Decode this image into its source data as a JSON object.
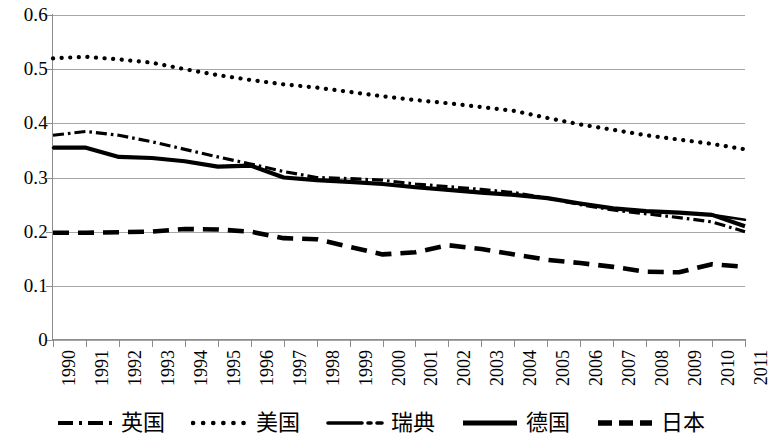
{
  "chart_data": {
    "type": "line",
    "title": "",
    "subtitle": "",
    "xlabel": "",
    "ylabel": "",
    "xlim": [
      1990,
      2011
    ],
    "ylim": [
      0,
      0.6
    ],
    "grid": true,
    "legend_position": "bottom",
    "y_ticks": [
      "0",
      "0.1",
      "0.2",
      "0.3",
      "0.4",
      "0.5",
      "0.6"
    ],
    "y_tick_values": [
      0,
      0.1,
      0.2,
      0.3,
      0.4,
      0.5,
      0.6
    ],
    "categories": [
      "1990",
      "1991",
      "1992",
      "1993",
      "1994",
      "1995",
      "1996",
      "1997",
      "1998",
      "1999",
      "2000",
      "2001",
      "2002",
      "2003",
      "2004",
      "2005",
      "2006",
      "2007",
      "2008",
      "2009",
      "2010",
      "2011"
    ],
    "x": [
      1990,
      1991,
      1992,
      1993,
      1994,
      1995,
      1996,
      1997,
      1998,
      1999,
      2000,
      2001,
      2002,
      2003,
      2004,
      2005,
      2006,
      2007,
      2008,
      2009,
      2010,
      2011
    ],
    "series": [
      {
        "name": "英国",
        "style": "dash-dot",
        "color": "#000000",
        "values": [
          0.378,
          0.385,
          0.378,
          0.366,
          0.352,
          0.338,
          0.325,
          0.311,
          0.3,
          0.298,
          0.295,
          0.288,
          0.283,
          0.278,
          0.272,
          0.262,
          0.25,
          0.24,
          0.233,
          0.226,
          0.218,
          0.2
        ]
      },
      {
        "name": "美国",
        "style": "dotted",
        "color": "#000000",
        "values": [
          0.52,
          0.523,
          0.518,
          0.512,
          0.5,
          0.489,
          0.48,
          0.472,
          0.466,
          0.458,
          0.45,
          0.443,
          0.437,
          0.43,
          0.423,
          0.41,
          0.398,
          0.388,
          0.378,
          0.37,
          0.362,
          0.352
        ]
      },
      {
        "name": "瑞典",
        "style": "solid-thin",
        "color": "#000000",
        "values": [
          0.355,
          0.355,
          0.338,
          0.336,
          0.33,
          0.32,
          0.322,
          0.3,
          0.295,
          0.292,
          0.288,
          0.282,
          0.277,
          0.272,
          0.268,
          0.262,
          0.252,
          0.243,
          0.238,
          0.235,
          0.231,
          0.222
        ]
      },
      {
        "name": "德国",
        "style": "solid-thick",
        "color": "#000000",
        "values": [
          0.355,
          0.355,
          0.338,
          0.336,
          0.33,
          0.32,
          0.322,
          0.3,
          0.295,
          0.292,
          0.288,
          0.282,
          0.277,
          0.272,
          0.268,
          0.262,
          0.252,
          0.243,
          0.238,
          0.235,
          0.231,
          0.21
        ]
      },
      {
        "name": "日本",
        "style": "long-dash",
        "color": "#000000",
        "values": [
          0.198,
          0.198,
          0.199,
          0.2,
          0.205,
          0.204,
          0.2,
          0.188,
          0.186,
          0.172,
          0.158,
          0.162,
          0.175,
          0.168,
          0.158,
          0.148,
          0.142,
          0.135,
          0.126,
          0.125,
          0.14,
          0.135
        ]
      }
    ]
  },
  "legend": {
    "items": [
      {
        "label": "英国",
        "swatch": "dash-dot-swatch"
      },
      {
        "label": "美国",
        "swatch": "dotted-swatch"
      },
      {
        "label": "瑞典",
        "swatch": "solid-thin-swatch"
      },
      {
        "label": "德国",
        "swatch": "solid-thick-swatch"
      },
      {
        "label": "日本",
        "swatch": "long-dash-swatch"
      }
    ]
  },
  "axes": {
    "y_labels": [
      "0.6",
      "0.5",
      "0.4",
      "0.3",
      "0.2",
      "0.1",
      "0"
    ],
    "x_labels": [
      "1990",
      "1991",
      "1992",
      "1993",
      "1994",
      "1995",
      "1996",
      "1997",
      "1998",
      "1999",
      "2000",
      "2001",
      "2002",
      "2003",
      "2004",
      "2005",
      "2006",
      "2007",
      "2008",
      "2009",
      "2010",
      "2011"
    ]
  },
  "colors": {
    "axis": "#8c8c8c",
    "grid": "#a6a6a6",
    "series": "#000000",
    "background": "#ffffff"
  }
}
